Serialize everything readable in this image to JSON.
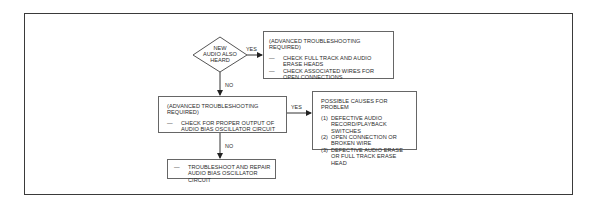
{
  "diagram": {
    "decision": {
      "lines": [
        "NEW",
        "AUDIO ALSO",
        "HEARD"
      ]
    },
    "labels": {
      "decision_yes": "YES",
      "decision_no": "NO",
      "check_yes": "YES",
      "check_no": "NO"
    },
    "box_advanced_1": {
      "title": "(ADVANCED TROUBLESHOOTING REQUIRED)",
      "items": [
        {
          "dash": "—",
          "text": "CHECK FULL TRACK AND AUDIO ERASE HEADS"
        },
        {
          "dash": "—",
          "text": "CHECK ASSOCIATED WIRES FOR OPEN CONNECTIONS"
        }
      ]
    },
    "box_advanced_2": {
      "title": "(ADVANCED TROUBLESHOOTING REQUIRED)",
      "items": [
        {
          "dash": "—",
          "text": "CHECK FOR PROPER OUTPUT OF AUDIO BIAS OSCILLATOR CIRCUIT"
        }
      ]
    },
    "box_causes": {
      "title": "POSSIBLE CAUSES FOR PROBLEM",
      "items": [
        {
          "num": "(1)",
          "text": "DEFECTIVE AUDIO RECORD/PLAYBACK SWITCHES"
        },
        {
          "num": "(2)",
          "text": "OPEN CONNECTION OR BROKEN WIRE"
        },
        {
          "num": "(3)",
          "text": "DEFECTIVE AUDIO ERASE OR FULL TRACK ERASE HEAD"
        }
      ]
    },
    "box_repair": {
      "items": [
        {
          "dash": "—",
          "text": "TROUBLESHOOT AND REPAIR AUDIO BIAS OSCILLATOR CIRCUIT"
        }
      ]
    }
  }
}
